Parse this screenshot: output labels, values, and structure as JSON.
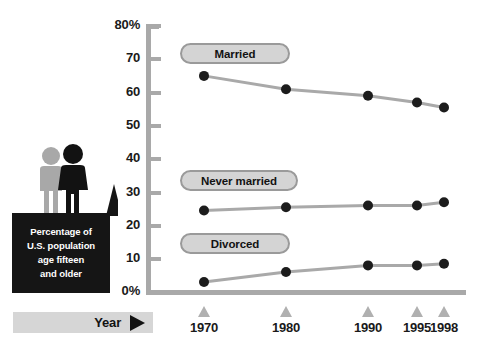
{
  "chart_data": {
    "type": "line",
    "title": "",
    "xlabel": "Year",
    "ylabel": "Percentage of U.S. population age fifteen and older",
    "x": [
      1970,
      1980,
      1990,
      1995,
      1998
    ],
    "xtick_labels": [
      "1970",
      "1980",
      "1990",
      "1995",
      "1998"
    ],
    "ytick_labels": [
      "0%",
      "10",
      "20",
      "30",
      "40",
      "50",
      "60",
      "70",
      "80%"
    ],
    "yticks": [
      0,
      10,
      20,
      30,
      40,
      50,
      60,
      70,
      80
    ],
    "ylim": [
      0,
      80
    ],
    "grid": false,
    "legend_position": "inline-pill-labels",
    "series": [
      {
        "name": "Married",
        "values": [
          65,
          61,
          59,
          57,
          55.5
        ]
      },
      {
        "name": "Never married",
        "values": [
          24.5,
          25.5,
          26,
          26,
          27
        ]
      },
      {
        "name": "Divorced",
        "values": [
          3,
          6,
          8,
          8,
          8.5
        ]
      }
    ]
  },
  "axes": {
    "y_labels": [
      "80%",
      "70",
      "60",
      "50",
      "40",
      "30",
      "20",
      "10",
      "0%"
    ],
    "x_labels": [
      "1970",
      "1980",
      "1990",
      "1995",
      "1998"
    ]
  },
  "series_labels": {
    "married": "Married",
    "never_married": "Never married",
    "divorced": "Divorced"
  },
  "caption": {
    "lines": [
      "Percentage of",
      "U.S. population",
      "age fifteen",
      "and older"
    ]
  },
  "year_bar": {
    "label": "Year"
  },
  "colors": {
    "axis": "#a9a9a9",
    "marker": "#1c1c1c",
    "line": "#a9a9a9",
    "pill_fill": "#d4d4d4",
    "pill_border": "#9a9a9a",
    "caption_bg": "#151515",
    "caption_text": "#ffffff",
    "year_bar_bg": "#d6d6d6",
    "tick_marker": "#b0b0b0",
    "figure_gray": "#a8a8a8",
    "figure_black": "#121212"
  }
}
